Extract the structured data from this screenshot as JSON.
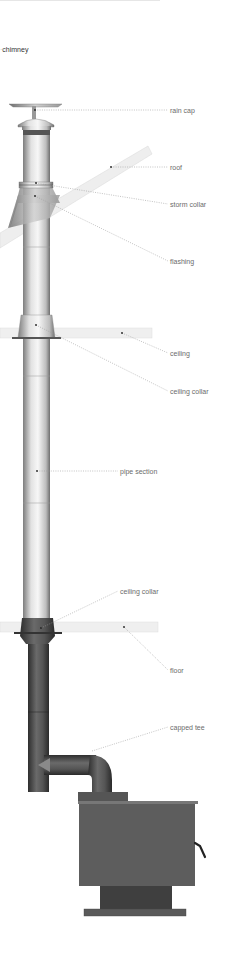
{
  "title": "chimney",
  "colors": {
    "background": "#ffffff",
    "label_text": "#6b6b6b",
    "leader_line": "#9a9a9a",
    "pipe_light": "#e8e8e8",
    "pipe_dark": "#8a8a8a",
    "stove_pipe": "#4a4a4a",
    "stove_body": "#5c5c5c",
    "structure": "#ececec"
  },
  "labels": [
    {
      "id": "rain-cap",
      "text": "rain cap"
    },
    {
      "id": "roof",
      "text": "roof"
    },
    {
      "id": "storm-collar",
      "text": "storm collar"
    },
    {
      "id": "flashing",
      "text": "flashing"
    },
    {
      "id": "ceiling",
      "text": "ceiling"
    },
    {
      "id": "ceiling-collar-upper",
      "text": "ceiling collar"
    },
    {
      "id": "pipe-section",
      "text": "pipe section"
    },
    {
      "id": "ceiling-collar-lower",
      "text": "ceiling collar"
    },
    {
      "id": "floor",
      "text": "floor"
    },
    {
      "id": "capped-tee",
      "text": "capped tee"
    }
  ]
}
